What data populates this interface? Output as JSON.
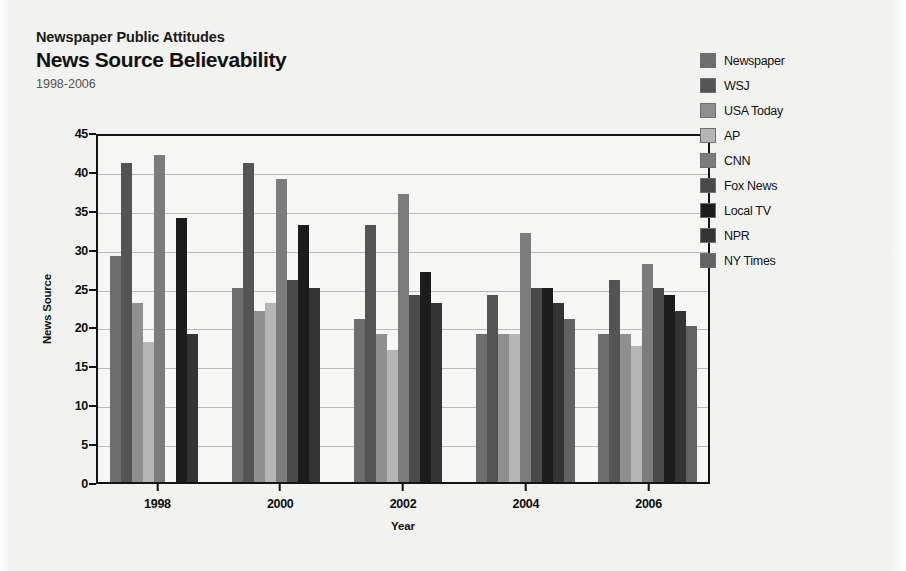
{
  "header": {
    "kicker": "Newspaper Public Attitudes",
    "title": "News Source Believability",
    "subtitle": "1998-2006"
  },
  "legend": {
    "position": "right",
    "items": [
      {
        "label": "Newspaper",
        "color": "#6e6e6e"
      },
      {
        "label": "WSJ",
        "color": "#545454"
      },
      {
        "label": "USA Today",
        "color": "#8f8f8f"
      },
      {
        "label": "AP",
        "color": "#b5b5b5"
      },
      {
        "label": "CNN",
        "color": "#7c7c7c"
      },
      {
        "label": "Fox News",
        "color": "#4a4a4a"
      },
      {
        "label": "Local TV",
        "color": "#1c1c1c"
      },
      {
        "label": "NPR",
        "color": "#343434"
      },
      {
        "label": "NY Times",
        "color": "#626262"
      }
    ]
  },
  "chart_data": {
    "type": "bar",
    "title": "News Source Believability",
    "subtitle": "1998-2006",
    "xlabel": "Year",
    "ylabel": "News Source",
    "categories": [
      "1998",
      "2000",
      "2002",
      "2004",
      "2006"
    ],
    "yticks": [
      0,
      5,
      10,
      15,
      20,
      25,
      30,
      35,
      40,
      45
    ],
    "ylim": [
      0,
      45
    ],
    "grid": true,
    "legend_position": "right",
    "series": [
      {
        "name": "Newspaper",
        "color": "#6e6e6e",
        "values": [
          29,
          25,
          21,
          19,
          19
        ]
      },
      {
        "name": "WSJ",
        "color": "#545454",
        "values": [
          41,
          41,
          33,
          24,
          26
        ]
      },
      {
        "name": "USA Today",
        "color": "#8f8f8f",
        "values": [
          23,
          22,
          19,
          19,
          19
        ]
      },
      {
        "name": "AP",
        "color": "#b5b5b5",
        "values": [
          18,
          23,
          17,
          19,
          17.5
        ]
      },
      {
        "name": "CNN",
        "color": "#7c7c7c",
        "values": [
          42,
          39,
          37,
          32,
          28
        ]
      },
      {
        "name": "Fox News",
        "color": "#4a4a4a",
        "values": [
          0,
          26,
          24,
          25,
          25
        ]
      },
      {
        "name": "Local TV",
        "color": "#1c1c1c",
        "values": [
          34,
          33,
          27,
          25,
          24
        ]
      },
      {
        "name": "NPR",
        "color": "#343434",
        "values": [
          19,
          25,
          23,
          23,
          22
        ]
      },
      {
        "name": "NY Times",
        "color": "#626262",
        "values": [
          0,
          0,
          0,
          21,
          20
        ]
      }
    ]
  }
}
